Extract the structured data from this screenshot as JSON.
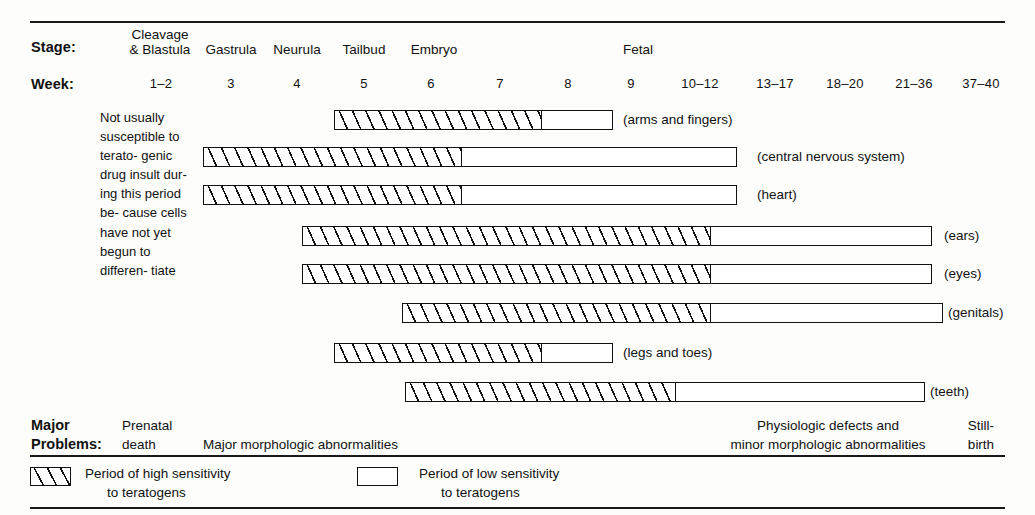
{
  "figure": {
    "stage_row_label": "Stage:",
    "week_row_label": "Week:",
    "problems_row_label_line1": "Major",
    "problems_row_label_line2": "Problems:"
  },
  "intro_note": "Not usually susceptible to terato- genic drug insult dur- ing this period be- cause cells have not yet begun to differen- tiate",
  "stages": [
    {
      "name": "cleavage-blastula",
      "line1": "Cleavage",
      "line2": "& Blastula",
      "x": 160,
      "width": 96
    },
    {
      "name": "gastrula",
      "line1": "",
      "line2": "Gastrula",
      "x": 231,
      "width": 74
    },
    {
      "name": "neurula",
      "line1": "",
      "line2": "Neurula",
      "x": 297,
      "width": 70
    },
    {
      "name": "tailbud",
      "line1": "",
      "line2": "Tailbud",
      "x": 364,
      "width": 66
    },
    {
      "name": "embryo",
      "line1": "",
      "line2": "Embryo",
      "x": 434,
      "width": 70
    },
    {
      "name": "fetal",
      "line1": "",
      "line2": "Fetal",
      "x": 638,
      "width": 50
    }
  ],
  "week_ticks": [
    {
      "label": "1–2",
      "x": 161
    },
    {
      "label": "3",
      "x": 231
    },
    {
      "label": "4",
      "x": 297
    },
    {
      "label": "5",
      "x": 364
    },
    {
      "label": "6",
      "x": 431
    },
    {
      "label": "7",
      "x": 500
    },
    {
      "label": "8",
      "x": 568
    },
    {
      "label": "9",
      "x": 631
    },
    {
      "label": "10–12",
      "x": 700
    },
    {
      "label": "13–17",
      "x": 775
    },
    {
      "label": "18–20",
      "x": 845
    },
    {
      "label": "21–36",
      "x": 914
    },
    {
      "label": "37–40",
      "x": 981
    }
  ],
  "chart_data": {
    "type": "bar",
    "xlabel": "Week",
    "ylabel": "",
    "x_ticks": [
      "1–2",
      "3",
      "4",
      "5",
      "6",
      "7",
      "8",
      "9",
      "10–12",
      "13–17",
      "18–20",
      "21–36",
      "37–40"
    ],
    "legend": [
      {
        "key": "high",
        "label": "Period of high sensitivity to teratogens"
      },
      {
        "key": "low",
        "label": "Period of low sensitivity to teratogens"
      }
    ],
    "series": [
      {
        "name": "arms and fingers",
        "start_week": 4.6,
        "high_end_week": 7.6,
        "end_week": 8.7
      },
      {
        "name": "central nervous system",
        "start_week": 2.6,
        "high_end_week": 6.5,
        "end_week": 10.4
      },
      {
        "name": "heart",
        "start_week": 2.6,
        "high_end_week": 6.5,
        "end_week": 10.4
      },
      {
        "name": "ears",
        "start_week": 4.1,
        "high_end_week": 10.1,
        "end_week": 21.0
      },
      {
        "name": "eyes",
        "start_week": 4.1,
        "high_end_week": 10.1,
        "end_week": 21.0
      },
      {
        "name": "genitals",
        "start_week": 5.6,
        "high_end_week": 10.1,
        "end_week": 21.6
      },
      {
        "name": "legs and toes",
        "start_week": 4.6,
        "high_end_week": 7.6,
        "end_week": 8.7
      },
      {
        "name": "teeth",
        "start_week": 5.6,
        "high_end_week": 9.6,
        "end_week": 20.6
      }
    ]
  },
  "bars": [
    {
      "name": "arms-and-fingers",
      "label": "(arms and fingers)",
      "left": 334,
      "high_width": 207,
      "total_width": 279,
      "top": 110,
      "label_x": 623
    },
    {
      "name": "central-nervous-system",
      "label": "(central nervous system)",
      "left": 203,
      "high_width": 258,
      "total_width": 534,
      "top": 147,
      "label_x": 757
    },
    {
      "name": "heart",
      "label": "(heart)",
      "left": 203,
      "high_width": 258,
      "total_width": 534,
      "top": 185,
      "label_x": 757
    },
    {
      "name": "ears",
      "label": "(ears)",
      "left": 302,
      "high_width": 408,
      "total_width": 630,
      "top": 226,
      "label_x": 944
    },
    {
      "name": "eyes",
      "label": "(eyes)",
      "left": 302,
      "high_width": 408,
      "total_width": 630,
      "top": 264,
      "label_x": 944
    },
    {
      "name": "genitals",
      "label": "(genitals)",
      "left": 402,
      "high_width": 308,
      "total_width": 541,
      "top": 303,
      "label_x": 948
    },
    {
      "name": "legs-and-toes",
      "label": "(legs and toes)",
      "left": 334,
      "high_width": 207,
      "total_width": 279,
      "top": 343,
      "label_x": 623
    },
    {
      "name": "teeth",
      "label": "(teeth)",
      "left": 405,
      "high_width": 270,
      "total_width": 520,
      "top": 382,
      "label_x": 930
    }
  ],
  "problems": [
    {
      "name": "prenatal-death",
      "line1": "Prenatal",
      "line2": "death",
      "x": 122,
      "align": "left"
    },
    {
      "name": "major-morphologic-abnormalities",
      "line1": "",
      "line2": "Major morphologic abnormalities",
      "x": 203,
      "align": "left"
    },
    {
      "name": "physiologic-and-minor-abnormalities",
      "line1": "Physiologic defects and",
      "line2": "minor morphologic abnormalities",
      "x": 828,
      "align": "center"
    },
    {
      "name": "stillbirth",
      "line1": "Still-",
      "line2": "birth",
      "x": 981,
      "align": "center"
    }
  ],
  "legend": {
    "high": {
      "name": "high-sensitivity",
      "line1": "Period of high sensitivity",
      "line2": "to teratogens",
      "swatch_x": 30,
      "text_x": 85
    },
    "low": {
      "name": "low-sensitivity",
      "line1": "Period of low sensitivity",
      "line2": "to teratogens",
      "swatch_x": 357,
      "text_x": 419
    }
  }
}
